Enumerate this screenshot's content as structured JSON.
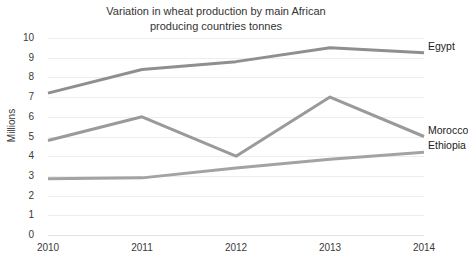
{
  "chart_data": {
    "type": "line",
    "title": "Variation in wheat production by main African\nproducing countries tonnes",
    "xlabel": "",
    "ylabel": "Millions",
    "categories": [
      "2010",
      "2011",
      "2012",
      "2013",
      "2014"
    ],
    "x": [
      2010,
      2011,
      2012,
      2013,
      2014
    ],
    "ylim": [
      0,
      10
    ],
    "ytick_step": 1,
    "yticks": [
      "10",
      "9",
      "8",
      "7",
      "6",
      "5",
      "4",
      "3",
      "2",
      "1",
      "0"
    ],
    "grid": true,
    "legend_position": "end-of-line labels",
    "series": [
      {
        "name": "Egypt",
        "values": [
          7.2,
          8.4,
          8.8,
          9.5,
          9.25
        ],
        "color": "#8f8f8f"
      },
      {
        "name": "Morocco",
        "values": [
          4.8,
          6.0,
          4.0,
          7.0,
          5.0
        ],
        "color": "#9a9a9a"
      },
      {
        "name": "Ethiopia",
        "values": [
          2.85,
          2.9,
          3.4,
          3.85,
          4.2
        ],
        "color": "#a3a3a3"
      }
    ]
  },
  "style": {
    "background": "#ffffff",
    "gridline_color": "#ededed",
    "text_color": "#333333"
  }
}
